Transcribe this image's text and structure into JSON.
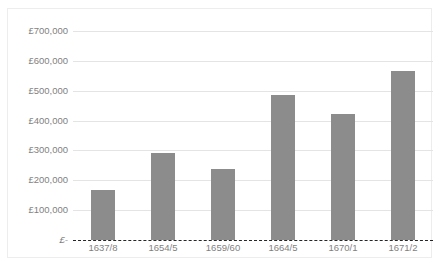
{
  "chart_data": {
    "type": "bar",
    "title": "",
    "subtitle": "",
    "xlabel": "",
    "ylabel": "",
    "categories": [
      "1637/8",
      "1654/5",
      "1659/60",
      "1664/5",
      "1670/1",
      "1671/2"
    ],
    "values": [
      168000,
      292000,
      238000,
      487000,
      423000,
      567000
    ],
    "series": [
      {
        "name": "",
        "values": [
          168000,
          292000,
          238000,
          487000,
          423000,
          567000
        ]
      }
    ],
    "ylim": [
      0,
      700000
    ],
    "ytick_values": [
      0,
      100000,
      200000,
      300000,
      400000,
      500000,
      600000,
      700000
    ],
    "ytick_labels": [
      "£-",
      "£100,000",
      "£200,000",
      "£300,000",
      "£400,000",
      "£500,000",
      "£600,000",
      "£700,000"
    ],
    "grid": true,
    "legend": false,
    "legend_position": "none",
    "annotations": [],
    "colors": {
      "bar_fill": "#8c8c8c",
      "gridline": "#e4e4e4",
      "zero_baseline": "#262626",
      "tick_label": "#7f7f7f",
      "frame_border": "#ededed",
      "background": "#ffffff"
    }
  }
}
